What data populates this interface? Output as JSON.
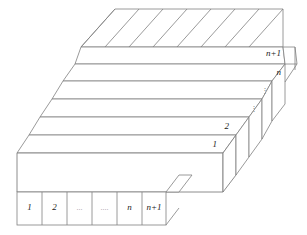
{
  "figure": {
    "type": "isometric-3d-grid",
    "stroke_color": "#808080",
    "accent_color": "#5a5a5a",
    "background_color": "#ffffff",
    "depth_axis": {
      "name": "rows",
      "labels": [
        "1",
        "2",
        "⋮",
        "⋮",
        "n",
        "n+1"
      ]
    },
    "width_axis": {
      "name": "columns",
      "labels": [
        "1",
        "2",
        "...",
        "....",
        "n",
        "n+1"
      ]
    },
    "depth_labels": {
      "row1": "1",
      "row2": "2",
      "row3": "⋮",
      "row4": "⋮",
      "row5": "n",
      "row6": "n+1"
    },
    "column_cells": [
      {
        "id": "col-1",
        "label": "1"
      },
      {
        "id": "col-2",
        "label": "2"
      },
      {
        "id": "col-3",
        "label": "..."
      },
      {
        "id": "col-4",
        "label": "...."
      },
      {
        "id": "col-5",
        "label": "n"
      },
      {
        "id": "col-6",
        "label": "n+1"
      }
    ],
    "counts": {
      "visible_strips": 6,
      "visible_columns": 6,
      "back_face_diagonals": 7
    }
  }
}
